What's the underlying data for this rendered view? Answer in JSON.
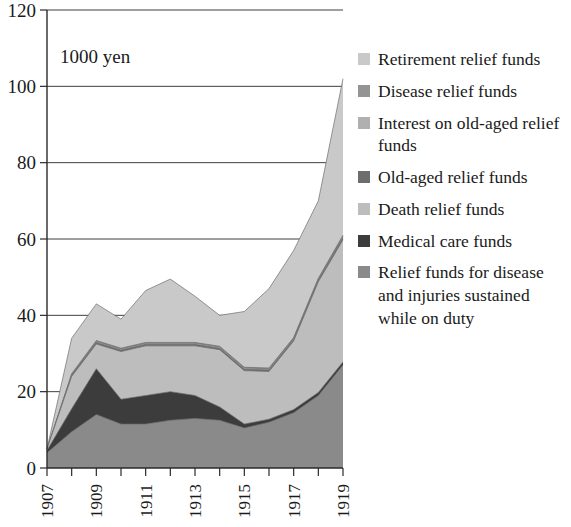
{
  "figure": {
    "unit_label": "1000 yen",
    "background_color": "#ffffff"
  },
  "legend": {
    "position": "right",
    "items": [
      {
        "label": "Retirement relief funds",
        "color": "#c9c9c9",
        "key": "retirement"
      },
      {
        "label": "Disease relief funds",
        "color": "#949494",
        "key": "disease"
      },
      {
        "label": "Interest on old-aged relief funds",
        "color": "#b0b0b0",
        "key": "interest_old_aged"
      },
      {
        "label": "Old-aged relief funds",
        "color": "#6d6d6d",
        "key": "old_aged"
      },
      {
        "label": "Death relief funds",
        "color": "#bdbdbd",
        "key": "death"
      },
      {
        "label": "Medical care funds",
        "color": "#3c3c3c",
        "key": "medical_care"
      },
      {
        "label": "Relief funds for disease and injuries sustained while on duty",
        "color": "#8a8a8a",
        "key": "duty_injury"
      }
    ]
  },
  "axes": {
    "y": {
      "min": 0,
      "max": 120,
      "tick_step": 20,
      "ticks": [
        0,
        20,
        40,
        60,
        80,
        100,
        120
      ],
      "tick_labels": [
        "0",
        "20",
        "40",
        "60",
        "80",
        "100",
        "120"
      ],
      "grid": true
    },
    "x": {
      "min": 1907,
      "max": 1919,
      "ticks": [
        1907,
        1908,
        1909,
        1910,
        1911,
        1912,
        1913,
        1914,
        1915,
        1916,
        1917,
        1918,
        1919
      ],
      "tick_labels": [
        "1907",
        "",
        "1909",
        "",
        "1911",
        "",
        "1913",
        "",
        "1915",
        "",
        "1917",
        "",
        "1919"
      ],
      "labelled_ticks": [
        "1907",
        "1909",
        "1911",
        "1913",
        "1915",
        "1917",
        "1919"
      ],
      "grid": false
    }
  },
  "chart_data": {
    "type": "area",
    "stacked": true,
    "title": "",
    "subtitle": "",
    "xlabel": "",
    "ylabel": "1000 yen",
    "xlim": [
      1907,
      1919
    ],
    "ylim": [
      0,
      120
    ],
    "grid": true,
    "legend_position": "right",
    "annotations": [
      "1000 yen"
    ],
    "x": [
      1907,
      1908,
      1909,
      1910,
      1911,
      1912,
      1913,
      1914,
      1915,
      1916,
      1917,
      1918,
      1919
    ],
    "categories": [
      "1907",
      "1908",
      "1909",
      "1910",
      "1911",
      "1912",
      "1913",
      "1914",
      "1915",
      "1916",
      "1917",
      "1918",
      "1919"
    ],
    "series": [
      {
        "name": "Relief funds for disease and injuries sustained while on duty",
        "color": "#8a8a8a",
        "stack_order": 1,
        "values": [
          4.0,
          9.5,
          14.0,
          11.5,
          11.5,
          12.5,
          13.0,
          12.5,
          10.5,
          12.0,
          14.5,
          19.0,
          27.0
        ]
      },
      {
        "name": "Medical care funds",
        "color": "#3c3c3c",
        "stack_order": 2,
        "values": [
          0.6,
          6.0,
          12.0,
          6.5,
          7.5,
          7.5,
          6.0,
          3.5,
          1.0,
          0.8,
          0.8,
          0.8,
          0.8
        ]
      },
      {
        "name": "Death relief funds",
        "color": "#bdbdbd",
        "stack_order": 3,
        "values": [
          0.4,
          8.5,
          6.5,
          12.5,
          13.0,
          12.0,
          13.0,
          15.0,
          14.0,
          12.5,
          18.0,
          29.0,
          32.0
        ]
      },
      {
        "name": "Old-aged relief funds",
        "color": "#6d6d6d",
        "stack_order": 4,
        "values": [
          0.0,
          0.3,
          0.4,
          0.4,
          0.4,
          0.4,
          0.4,
          0.4,
          0.4,
          0.4,
          0.4,
          0.4,
          0.5
        ]
      },
      {
        "name": "Interest on old-aged relief funds",
        "color": "#b0b0b0",
        "stack_order": 5,
        "values": [
          0.0,
          0.2,
          0.3,
          0.3,
          0.3,
          0.3,
          0.3,
          0.3,
          0.3,
          0.3,
          0.3,
          0.3,
          0.4
        ]
      },
      {
        "name": "Disease relief funds",
        "color": "#949494",
        "stack_order": 6,
        "values": [
          0.0,
          0.2,
          0.2,
          0.2,
          0.2,
          0.2,
          0.2,
          0.2,
          0.2,
          0.2,
          0.2,
          0.2,
          0.3
        ]
      },
      {
        "name": "Retirement relief funds",
        "color": "#c9c9c9",
        "stack_order": 7,
        "values": [
          0.0,
          9.3,
          9.6,
          7.6,
          13.6,
          16.6,
          12.1,
          8.1,
          14.6,
          20.8,
          22.8,
          20.3,
          41.0
        ]
      }
    ],
    "totals": [
      5.0,
      34.0,
      43.0,
      39.0,
      46.5,
      49.5,
      45.0,
      40.0,
      41.0,
      47.0,
      57.0,
      70.0,
      102.0
    ]
  }
}
